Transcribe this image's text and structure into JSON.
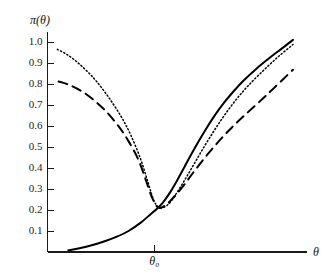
{
  "chart_data": {
    "type": "line",
    "title": "",
    "xlabel": "θ",
    "ylabel": "π(θ)",
    "xlim": [
      0,
      1
    ],
    "ylim": [
      0,
      1.05
    ],
    "grid": false,
    "legend": "none",
    "y_ticks": [
      "1.0",
      "0.9",
      "0.8",
      "0.7",
      "0.6",
      "0.5",
      "0.4",
      "0.3",
      "0.2",
      "0.1"
    ],
    "y_tick_values": [
      1.0,
      0.9,
      0.8,
      0.7,
      0.6,
      0.5,
      0.4,
      0.3,
      0.2,
      0.1
    ],
    "x_ticks": [
      "θ₀"
    ],
    "x_tick_values": [
      0.435
    ],
    "annotations": [
      {
        "name": "theta-zero-tick",
        "label": "θ₀",
        "x": 0.435
      }
    ],
    "series": [
      {
        "name": "solid",
        "style": "solid",
        "color": "#000000",
        "x": [
          0.085,
          0.13,
          0.18,
          0.23,
          0.28,
          0.33,
          0.38,
          0.42,
          0.445,
          0.47,
          0.5,
          0.53,
          0.56,
          0.6,
          0.64,
          0.68,
          0.72,
          0.76,
          0.8,
          0.85,
          0.9,
          0.95,
          1.0
        ],
        "y": [
          0.008,
          0.018,
          0.032,
          0.05,
          0.072,
          0.1,
          0.14,
          0.18,
          0.205,
          0.235,
          0.285,
          0.345,
          0.41,
          0.495,
          0.575,
          0.648,
          0.712,
          0.768,
          0.818,
          0.872,
          0.92,
          0.965,
          1.01
        ]
      },
      {
        "name": "dotted",
        "style": "dotted",
        "color": "#000000",
        "x": [
          0.04,
          0.08,
          0.12,
          0.16,
          0.2,
          0.25,
          0.3,
          0.34,
          0.38,
          0.41,
          0.435,
          0.46,
          0.49,
          0.52,
          0.56,
          0.6,
          0.64,
          0.68,
          0.72,
          0.77,
          0.82,
          0.88,
          0.94,
          1.0
        ],
        "y": [
          0.965,
          0.94,
          0.905,
          0.862,
          0.812,
          0.735,
          0.645,
          0.555,
          0.44,
          0.33,
          0.24,
          0.21,
          0.225,
          0.27,
          0.345,
          0.425,
          0.505,
          0.58,
          0.65,
          0.728,
          0.795,
          0.865,
          0.93,
          0.988
        ]
      },
      {
        "name": "dashed",
        "style": "dashed",
        "color": "#000000",
        "x": [
          0.045,
          0.09,
          0.14,
          0.19,
          0.24,
          0.29,
          0.33,
          0.37,
          0.4,
          0.425,
          0.45,
          0.48,
          0.52,
          0.56,
          0.6,
          0.65,
          0.7,
          0.75,
          0.8,
          0.86,
          0.92,
          1.0
        ],
        "y": [
          0.812,
          0.795,
          0.765,
          0.722,
          0.668,
          0.598,
          0.528,
          0.44,
          0.345,
          0.262,
          0.212,
          0.222,
          0.268,
          0.325,
          0.388,
          0.462,
          0.53,
          0.592,
          0.648,
          0.712,
          0.778,
          0.868
        ]
      }
    ]
  }
}
